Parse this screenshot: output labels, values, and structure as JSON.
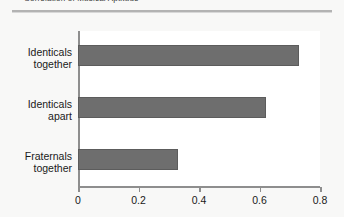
{
  "caption": {
    "text": "Correlation of Musical Aptitude"
  },
  "chart_data": {
    "type": "bar",
    "orientation": "horizontal",
    "title": "",
    "xlabel": "",
    "ylabel": "",
    "categories": [
      "Identicals together",
      "Identicals apart",
      "Fraternals together"
    ],
    "category_lines": [
      [
        "Identicals",
        "together"
      ],
      [
        "Identicals",
        "apart"
      ],
      [
        "Fraternals",
        "together"
      ]
    ],
    "values": [
      0.73,
      0.62,
      0.33
    ],
    "xlim": [
      0,
      0.8
    ],
    "xticks": [
      0,
      0.2,
      0.4,
      0.6,
      0.8
    ],
    "xtick_labels": [
      "0",
      "0.2",
      "0.4",
      "0.6",
      "0.8"
    ],
    "grid": false,
    "legend": false,
    "bar_color": "#6e6e6e",
    "bar_edge_color": "#5c5c5c",
    "axis_color": "#8e8e8e",
    "plot_background": "#ffffff",
    "figure_background": "#f8f8f7",
    "rule_color": "#b3b3b3"
  }
}
